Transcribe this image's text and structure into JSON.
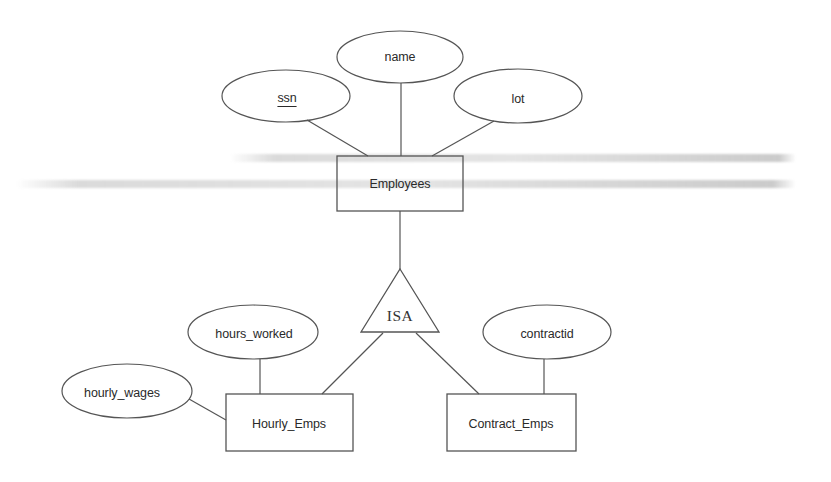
{
  "diagram": {
    "type": "ER diagram with ISA hierarchy",
    "stroke_color": "#555555",
    "text_color": "#2a2a2a",
    "entities": [
      {
        "id": "employees",
        "label": "Employees",
        "x": 337,
        "y": 156,
        "w": 126,
        "h": 55
      },
      {
        "id": "hourly_emps",
        "label": "Hourly_Emps",
        "x": 226,
        "y": 394,
        "w": 127,
        "h": 57
      },
      {
        "id": "contract_emps",
        "label": "Contract_Emps",
        "x": 447,
        "y": 394,
        "w": 129,
        "h": 57
      }
    ],
    "attributes": [
      {
        "id": "ssn",
        "label": "ssn",
        "key": true,
        "cx": 286,
        "cy": 96,
        "rx": 64,
        "ry": 26,
        "entity": "employees"
      },
      {
        "id": "name",
        "label": "name",
        "key": false,
        "cx": 400,
        "cy": 57,
        "rx": 63,
        "ry": 26,
        "entity": "employees"
      },
      {
        "id": "lot",
        "label": "lot",
        "key": false,
        "cx": 518,
        "cy": 96,
        "rx": 64,
        "ry": 27,
        "entity": "employees"
      },
      {
        "id": "hours_worked",
        "label": "hours_worked",
        "key": false,
        "cx": 253,
        "cy": 332,
        "rx": 65,
        "ry": 27,
        "entity": "hourly_emps"
      },
      {
        "id": "hourly_wages",
        "label": "hourly_wages",
        "key": false,
        "cx": 127,
        "cy": 391,
        "rx": 65,
        "ry": 27,
        "entity": "hourly_emps"
      },
      {
        "id": "contractid",
        "label": "contractid",
        "key": false,
        "cx": 547,
        "cy": 332,
        "rx": 64,
        "ry": 27,
        "entity": "contract_emps"
      }
    ],
    "isa": {
      "label": "ISA",
      "apex": [
        400,
        269
      ],
      "base_left": [
        361,
        332
      ],
      "base_right": [
        439,
        332
      ],
      "parent": "employees",
      "children": [
        "hourly_emps",
        "contract_emps"
      ]
    },
    "edges": [
      {
        "from": "ssn",
        "to": "employees",
        "x1": 307,
        "y1": 120,
        "x2": 368,
        "y2": 156
      },
      {
        "from": "name",
        "to": "employees",
        "x1": 401,
        "y1": 83,
        "x2": 401,
        "y2": 156
      },
      {
        "from": "lot",
        "to": "employees",
        "x1": 494,
        "y1": 121,
        "x2": 432,
        "y2": 156
      },
      {
        "from": "employees",
        "to": "isa",
        "x1": 400,
        "y1": 211,
        "x2": 400,
        "y2": 269
      },
      {
        "from": "isa",
        "to": "hourly_emps",
        "x1": 383,
        "y1": 333,
        "x2": 322,
        "y2": 394
      },
      {
        "from": "isa",
        "to": "contract_emps",
        "x1": 416,
        "y1": 333,
        "x2": 479,
        "y2": 394
      },
      {
        "from": "hours_worked",
        "to": "hourly_emps",
        "x1": 260,
        "y1": 359,
        "x2": 260,
        "y2": 394
      },
      {
        "from": "hourly_wages",
        "to": "hourly_emps",
        "x1": 189,
        "y1": 399,
        "x2": 226,
        "y2": 420
      },
      {
        "from": "contractid",
        "to": "contract_emps",
        "x1": 544,
        "y1": 359,
        "x2": 544,
        "y2": 394
      }
    ]
  }
}
